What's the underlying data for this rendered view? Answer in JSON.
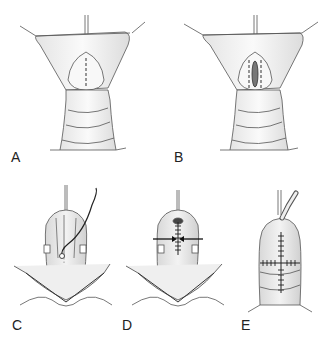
{
  "figure": {
    "panels": [
      {
        "id": "A",
        "label": "A",
        "description": "Retracted flaps with dashed midline incision line"
      },
      {
        "id": "B",
        "label": "B",
        "description": "Incision opened with parallel dashed lines"
      },
      {
        "id": "C",
        "label": "C",
        "description": "Suture needle passing through tissue"
      },
      {
        "id": "D",
        "label": "D",
        "description": "Sutured midline with arrows indicating approximation"
      },
      {
        "id": "E",
        "label": "E",
        "description": "Completed closure with vertical and horizontal suture lines and catheter"
      }
    ]
  }
}
